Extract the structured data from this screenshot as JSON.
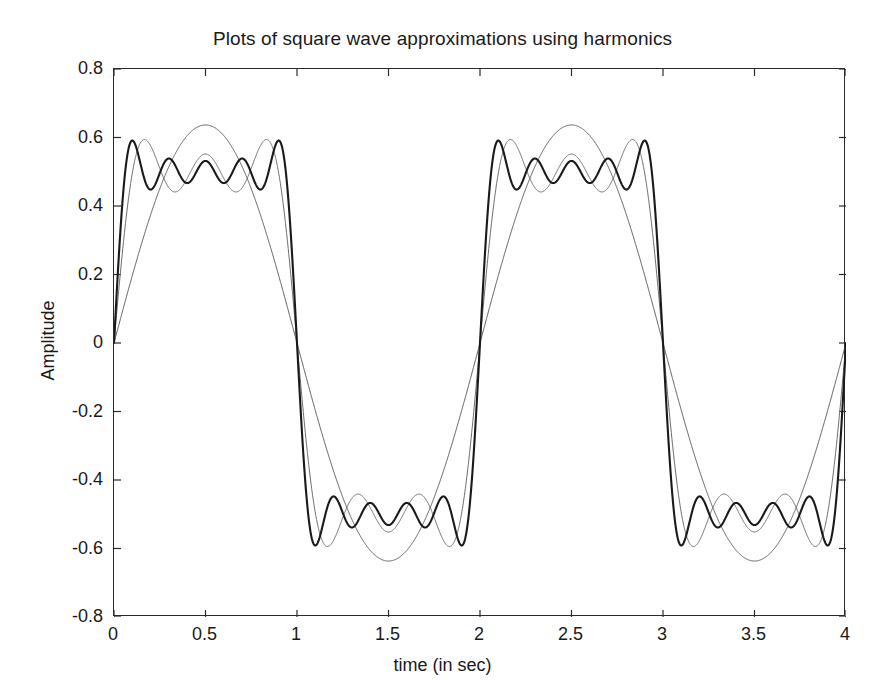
{
  "chart_data": {
    "type": "line",
    "title": "Plots of square wave approximations using harmonics",
    "xlabel": "time (in sec)",
    "ylabel": "Amplitude",
    "xlim": [
      0,
      4
    ],
    "ylim": [
      -0.8,
      0.8
    ],
    "xticks": [
      0,
      0.5,
      1,
      1.5,
      2,
      2.5,
      3,
      3.5,
      4
    ],
    "xticklabels": [
      "0",
      "0.5",
      "1",
      "1.5",
      "2",
      "2.5",
      "3",
      "3.5",
      "4"
    ],
    "yticks": [
      0.8,
      0.6,
      0.4,
      0.2,
      0,
      -0.2,
      -0.4,
      -0.6,
      -0.8
    ],
    "yticklabels": [
      "0.8",
      "0.6",
      "0.4",
      "0.2",
      "0",
      "-0.2",
      "-0.4",
      "-0.6",
      "-0.8"
    ],
    "grid": false,
    "legend": "none",
    "box": true,
    "tick_direction": "in",
    "waveform": "square wave Fourier sine series, period 2 sec, amplitude scale 0.5",
    "series": [
      {
        "name": "1 harmonic",
        "harmonics": [
          1
        ],
        "amplitude_scale": 0.5,
        "peak_value": 0.637,
        "peak_times": [
          0.5,
          2.5
        ],
        "trough_value": -0.637,
        "trough_times": [
          1.5,
          3.5
        ],
        "color": "#5a5a5a",
        "linewidth": 1.0,
        "ripple_count_per_half_period": 1
      },
      {
        "name": "3 harmonics",
        "harmonics": [
          1,
          3,
          5
        ],
        "amplitude_scale": 0.5,
        "peak_value": 0.588,
        "trough_value": -0.588,
        "color": "#6a6a6a",
        "linewidth": 1.0,
        "ripple_count_per_half_period": 3
      },
      {
        "name": "5 harmonics",
        "harmonics": [
          1,
          3,
          5,
          7,
          9
        ],
        "amplitude_scale": 0.5,
        "peak_value": 0.589,
        "trough_value": -0.589,
        "color": "#1a1a1a",
        "linewidth": 2.1,
        "ripple_count_per_half_period": 5
      }
    ]
  }
}
